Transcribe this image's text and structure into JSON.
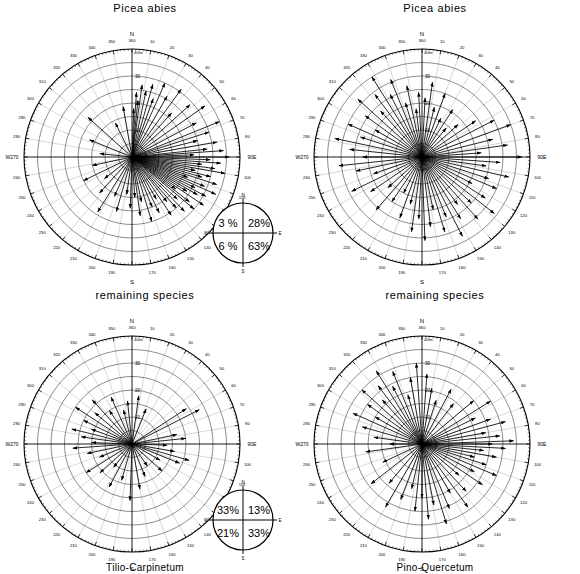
{
  "figure": {
    "panels": [
      {
        "id": "top-left",
        "title": "Picea abies",
        "caption": "",
        "quadrant_summary": {
          "nw": "3 %",
          "ne": "28%",
          "sw": "6 %",
          "se": "63%",
          "n": "N",
          "s": "S",
          "w": "W",
          "e": "E"
        }
      },
      {
        "id": "top-right",
        "title": "Picea abies",
        "caption": "",
        "quadrant_summary": null
      },
      {
        "id": "bottom-left",
        "title": "remaining species",
        "caption": "Tilio-Carpinetum",
        "quadrant_summary": {
          "nw": "33%",
          "ne": "13%",
          "sw": "21%",
          "se": "33%",
          "n": "N",
          "s": "S",
          "w": "W",
          "e": "E"
        }
      },
      {
        "id": "bottom-right",
        "title": "remaining species",
        "caption": "Pino-Quercetum",
        "quadrant_summary": null
      }
    ],
    "axis": {
      "cardinal_n": "N",
      "cardinal_s": "S",
      "cardinal_w": "W270",
      "cardinal_e": "90E",
      "radial_unit_label": "40m",
      "radial_ticks": [
        "10",
        "20",
        "30"
      ],
      "degree_labels": [
        "360",
        "10",
        "20",
        "30",
        "40",
        "50",
        "60",
        "70",
        "80",
        "100",
        "110",
        "120",
        "130",
        "140",
        "150",
        "160",
        "170",
        "180",
        "190",
        "200",
        "210",
        "220",
        "230",
        "240",
        "250",
        "260",
        "280",
        "290",
        "300",
        "310",
        "320",
        "330",
        "340",
        "350"
      ]
    }
  },
  "chart_data": {
    "type": "scatter",
    "xlabel": "azimuth (degrees, N = 0/360, E = 90, S = 180, W = 270)",
    "ylabel": "distance (m)",
    "rlim": [
      0,
      40
    ],
    "r_tick_interval": 5,
    "r_labeled_ticks": [
      10,
      20,
      30,
      40
    ],
    "theta_tick_interval": 10,
    "grid": true,
    "legend": "none",
    "series": [
      {
        "name": "Picea abies - Tilio-Carpinetum",
        "panel": "top-left",
        "quadrant_percent": {
          "NW": 3,
          "NE": 28,
          "SW": 6,
          "SE": 63
        },
        "points": [
          {
            "azimuth": 2,
            "r": 18
          },
          {
            "azimuth": 4,
            "r": 24
          },
          {
            "azimuth": 6,
            "r": 21
          },
          {
            "azimuth": 8,
            "r": 27
          },
          {
            "azimuth": 12,
            "r": 25
          },
          {
            "azimuth": 16,
            "r": 28
          },
          {
            "azimuth": 20,
            "r": 23
          },
          {
            "azimuth": 24,
            "r": 30
          },
          {
            "azimuth": 30,
            "r": 26
          },
          {
            "azimuth": 36,
            "r": 31
          },
          {
            "azimuth": 42,
            "r": 22
          },
          {
            "azimuth": 48,
            "r": 29
          },
          {
            "azimuth": 55,
            "r": 33
          },
          {
            "azimuth": 62,
            "r": 27
          },
          {
            "azimuth": 68,
            "r": 35
          },
          {
            "azimuth": 72,
            "r": 30
          },
          {
            "azimuth": 76,
            "r": 25
          },
          {
            "azimuth": 80,
            "r": 32
          },
          {
            "azimuth": 84,
            "r": 28
          },
          {
            "azimuth": 86,
            "r": 34
          },
          {
            "azimuth": 88,
            "r": 23
          },
          {
            "azimuth": 90,
            "r": 36
          },
          {
            "azimuth": 92,
            "r": 29
          },
          {
            "azimuth": 94,
            "r": 33
          },
          {
            "azimuth": 96,
            "r": 26
          },
          {
            "azimuth": 98,
            "r": 31
          },
          {
            "azimuth": 100,
            "r": 35
          },
          {
            "azimuth": 102,
            "r": 24
          },
          {
            "azimuth": 104,
            "r": 30
          },
          {
            "azimuth": 106,
            "r": 27
          },
          {
            "azimuth": 108,
            "r": 33
          },
          {
            "azimuth": 110,
            "r": 22
          },
          {
            "azimuth": 112,
            "r": 29
          },
          {
            "azimuth": 114,
            "r": 34
          },
          {
            "azimuth": 116,
            "r": 26
          },
          {
            "azimuth": 118,
            "r": 31
          },
          {
            "azimuth": 120,
            "r": 28
          },
          {
            "azimuth": 122,
            "r": 24
          },
          {
            "azimuth": 124,
            "r": 32
          },
          {
            "azimuth": 126,
            "r": 20
          },
          {
            "azimuth": 128,
            "r": 27
          },
          {
            "azimuth": 130,
            "r": 30
          },
          {
            "azimuth": 133,
            "r": 23
          },
          {
            "azimuth": 136,
            "r": 28
          },
          {
            "azimuth": 139,
            "r": 25
          },
          {
            "azimuth": 142,
            "r": 21
          },
          {
            "azimuth": 146,
            "r": 26
          },
          {
            "azimuth": 150,
            "r": 18
          },
          {
            "azimuth": 154,
            "r": 23
          },
          {
            "azimuth": 158,
            "r": 20
          },
          {
            "azimuth": 163,
            "r": 25
          },
          {
            "azimuth": 168,
            "r": 17
          },
          {
            "azimuth": 172,
            "r": 22
          },
          {
            "azimuth": 176,
            "r": 15
          },
          {
            "azimuth": 182,
            "r": 19
          },
          {
            "azimuth": 188,
            "r": 14
          },
          {
            "azimuth": 196,
            "r": 21
          },
          {
            "azimuth": 204,
            "r": 16
          },
          {
            "azimuth": 212,
            "r": 24
          },
          {
            "azimuth": 222,
            "r": 18
          },
          {
            "azimuth": 232,
            "r": 13
          },
          {
            "azimuth": 244,
            "r": 20
          },
          {
            "azimuth": 258,
            "r": 15
          },
          {
            "azimuth": 276,
            "r": 12
          },
          {
            "azimuth": 292,
            "r": 17
          },
          {
            "azimuth": 312,
            "r": 22
          },
          {
            "azimuth": 334,
            "r": 14
          },
          {
            "azimuth": 350,
            "r": 19
          }
        ]
      },
      {
        "name": "Picea abies - Pino-Quercetum",
        "panel": "top-right",
        "quadrant_percent": null,
        "points": [
          {
            "azimuth": 3,
            "r": 22
          },
          {
            "azimuth": 8,
            "r": 28
          },
          {
            "azimuth": 14,
            "r": 19
          },
          {
            "azimuth": 20,
            "r": 25
          },
          {
            "azimuth": 26,
            "r": 16
          },
          {
            "azimuth": 33,
            "r": 21
          },
          {
            "azimuth": 40,
            "r": 14
          },
          {
            "azimuth": 48,
            "r": 18
          },
          {
            "azimuth": 56,
            "r": 24
          },
          {
            "azimuth": 63,
            "r": 30
          },
          {
            "azimuth": 70,
            "r": 35
          },
          {
            "azimuth": 76,
            "r": 27
          },
          {
            "azimuth": 82,
            "r": 32
          },
          {
            "azimuth": 86,
            "r": 22
          },
          {
            "azimuth": 90,
            "r": 37
          },
          {
            "azimuth": 94,
            "r": 29
          },
          {
            "azimuth": 98,
            "r": 24
          },
          {
            "azimuth": 103,
            "r": 33
          },
          {
            "azimuth": 108,
            "r": 26
          },
          {
            "azimuth": 113,
            "r": 30
          },
          {
            "azimuth": 118,
            "r": 21
          },
          {
            "azimuth": 123,
            "r": 28
          },
          {
            "azimuth": 128,
            "r": 34
          },
          {
            "azimuth": 133,
            "r": 25
          },
          {
            "azimuth": 138,
            "r": 31
          },
          {
            "azimuth": 143,
            "r": 22
          },
          {
            "azimuth": 148,
            "r": 27
          },
          {
            "azimuth": 153,
            "r": 33
          },
          {
            "azimuth": 158,
            "r": 24
          },
          {
            "azimuth": 163,
            "r": 29
          },
          {
            "azimuth": 168,
            "r": 20
          },
          {
            "azimuth": 173,
            "r": 26
          },
          {
            "azimuth": 178,
            "r": 31
          },
          {
            "azimuth": 183,
            "r": 23
          },
          {
            "azimuth": 188,
            "r": 28
          },
          {
            "azimuth": 194,
            "r": 18
          },
          {
            "azimuth": 200,
            "r": 24
          },
          {
            "azimuth": 207,
            "r": 15
          },
          {
            "azimuth": 214,
            "r": 20
          },
          {
            "azimuth": 221,
            "r": 26
          },
          {
            "azimuth": 228,
            "r": 17
          },
          {
            "azimuth": 236,
            "r": 23
          },
          {
            "azimuth": 244,
            "r": 29
          },
          {
            "azimuth": 251,
            "r": 19
          },
          {
            "azimuth": 258,
            "r": 25
          },
          {
            "azimuth": 264,
            "r": 31
          },
          {
            "azimuth": 270,
            "r": 22
          },
          {
            "azimuth": 276,
            "r": 27
          },
          {
            "azimuth": 282,
            "r": 33
          },
          {
            "azimuth": 288,
            "r": 24
          },
          {
            "azimuth": 294,
            "r": 30
          },
          {
            "azimuth": 300,
            "r": 20
          },
          {
            "azimuth": 306,
            "r": 26
          },
          {
            "azimuth": 312,
            "r": 32
          },
          {
            "azimuth": 318,
            "r": 23
          },
          {
            "azimuth": 323,
            "r": 29
          },
          {
            "azimuth": 328,
            "r": 35
          },
          {
            "azimuth": 333,
            "r": 26
          },
          {
            "azimuth": 338,
            "r": 31
          },
          {
            "azimuth": 343,
            "r": 21
          },
          {
            "azimuth": 348,
            "r": 27
          },
          {
            "azimuth": 353,
            "r": 18
          },
          {
            "azimuth": 357,
            "r": 24
          }
        ]
      },
      {
        "name": "remaining species - Tilio-Carpinetum",
        "panel": "bottom-left",
        "quadrant_percent": {
          "NW": 33,
          "NE": 13,
          "SW": 21,
          "SE": 33
        },
        "points": [
          {
            "azimuth": 8,
            "r": 18
          },
          {
            "azimuth": 22,
            "r": 14
          },
          {
            "azimuth": 57,
            "r": 24
          },
          {
            "azimuth": 63,
            "r": 28
          },
          {
            "azimuth": 78,
            "r": 17
          },
          {
            "azimuth": 84,
            "r": 20
          },
          {
            "azimuth": 92,
            "r": 13
          },
          {
            "azimuth": 100,
            "r": 16
          },
          {
            "azimuth": 106,
            "r": 22
          },
          {
            "azimuth": 112,
            "r": 19
          },
          {
            "azimuth": 120,
            "r": 12
          },
          {
            "azimuth": 132,
            "r": 15
          },
          {
            "azimuth": 145,
            "r": 10
          },
          {
            "azimuth": 158,
            "r": 13
          },
          {
            "azimuth": 170,
            "r": 17
          },
          {
            "azimuth": 182,
            "r": 21
          },
          {
            "azimuth": 196,
            "r": 14
          },
          {
            "azimuth": 208,
            "r": 18
          },
          {
            "azimuth": 218,
            "r": 11
          },
          {
            "azimuth": 228,
            "r": 16
          },
          {
            "azimuth": 238,
            "r": 20
          },
          {
            "azimuth": 248,
            "r": 13
          },
          {
            "azimuth": 258,
            "r": 17
          },
          {
            "azimuth": 266,
            "r": 22
          },
          {
            "azimuth": 272,
            "r": 15
          },
          {
            "azimuth": 278,
            "r": 19
          },
          {
            "azimuth": 284,
            "r": 23
          },
          {
            "azimuth": 290,
            "r": 16
          },
          {
            "azimuth": 296,
            "r": 20
          },
          {
            "azimuth": 303,
            "r": 25
          },
          {
            "azimuth": 310,
            "r": 18
          },
          {
            "azimuth": 318,
            "r": 22
          },
          {
            "azimuth": 326,
            "r": 15
          },
          {
            "azimuth": 336,
            "r": 19
          },
          {
            "azimuth": 346,
            "r": 13
          },
          {
            "azimuth": 354,
            "r": 16
          }
        ]
      },
      {
        "name": "remaining species - Pino-Quercetum",
        "panel": "bottom-right",
        "quadrant_percent": null,
        "points": [
          {
            "azimuth": 4,
            "r": 26
          },
          {
            "azimuth": 10,
            "r": 21
          },
          {
            "azimuth": 18,
            "r": 17
          },
          {
            "azimuth": 28,
            "r": 23
          },
          {
            "azimuth": 38,
            "r": 19
          },
          {
            "azimuth": 50,
            "r": 25
          },
          {
            "azimuth": 58,
            "r": 30
          },
          {
            "azimuth": 64,
            "r": 22
          },
          {
            "azimuth": 70,
            "r": 27
          },
          {
            "azimuth": 75,
            "r": 32
          },
          {
            "azimuth": 80,
            "r": 24
          },
          {
            "azimuth": 84,
            "r": 29
          },
          {
            "azimuth": 88,
            "r": 34
          },
          {
            "azimuth": 90,
            "r": 26
          },
          {
            "azimuth": 93,
            "r": 31
          },
          {
            "azimuth": 96,
            "r": 23
          },
          {
            "azimuth": 100,
            "r": 28
          },
          {
            "azimuth": 104,
            "r": 20
          },
          {
            "azimuth": 108,
            "r": 25
          },
          {
            "azimuth": 113,
            "r": 30
          },
          {
            "azimuth": 118,
            "r": 22
          },
          {
            "azimuth": 124,
            "r": 27
          },
          {
            "azimuth": 130,
            "r": 18
          },
          {
            "azimuth": 137,
            "r": 24
          },
          {
            "azimuth": 144,
            "r": 29
          },
          {
            "azimuth": 150,
            "r": 21
          },
          {
            "azimuth": 157,
            "r": 26
          },
          {
            "azimuth": 163,
            "r": 31
          },
          {
            "azimuth": 169,
            "r": 23
          },
          {
            "azimuth": 175,
            "r": 28
          },
          {
            "azimuth": 180,
            "r": 20
          },
          {
            "azimuth": 186,
            "r": 25
          },
          {
            "azimuth": 193,
            "r": 17
          },
          {
            "azimuth": 201,
            "r": 22
          },
          {
            "azimuth": 210,
            "r": 27
          },
          {
            "azimuth": 220,
            "r": 19
          },
          {
            "azimuth": 232,
            "r": 24
          },
          {
            "azimuth": 245,
            "r": 16
          },
          {
            "azimuth": 262,
            "r": 21
          },
          {
            "azimuth": 270,
            "r": 12
          },
          {
            "azimuth": 278,
            "r": 18
          },
          {
            "azimuth": 286,
            "r": 23
          },
          {
            "azimuth": 294,
            "r": 28
          },
          {
            "azimuth": 300,
            "r": 20
          },
          {
            "azimuth": 306,
            "r": 25
          },
          {
            "azimuth": 312,
            "r": 30
          },
          {
            "azimuth": 318,
            "r": 22
          },
          {
            "azimuth": 323,
            "r": 27
          },
          {
            "azimuth": 328,
            "r": 32
          },
          {
            "azimuth": 333,
            "r": 24
          },
          {
            "azimuth": 338,
            "r": 29
          },
          {
            "azimuth": 344,
            "r": 19
          },
          {
            "azimuth": 350,
            "r": 25
          },
          {
            "azimuth": 356,
            "r": 30
          }
        ]
      }
    ]
  }
}
